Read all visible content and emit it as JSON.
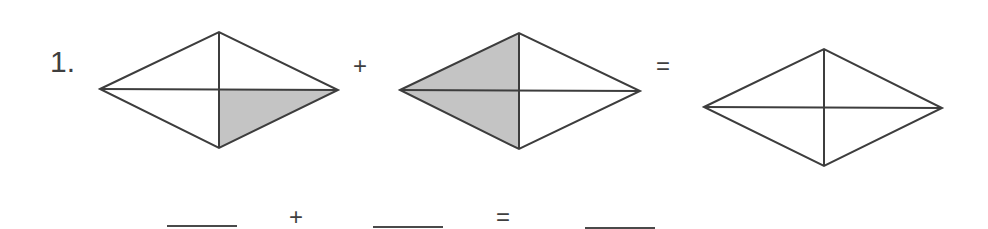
{
  "problem": {
    "number_label": "1.",
    "operators": {
      "plus": "+",
      "equals": "="
    },
    "diamonds": [
      {
        "id": "diamond-1",
        "parts": 4,
        "shaded_parts": 1,
        "shaded_region": "lower-right",
        "points": {
          "left": [
            100,
            89
          ],
          "top": [
            219,
            32
          ],
          "right": [
            338,
            90
          ],
          "bottom": [
            219,
            148
          ]
        }
      },
      {
        "id": "diamond-2",
        "parts": 4,
        "shaded_parts": 2,
        "shaded_region": "left-half",
        "points": {
          "left": [
            400,
            90
          ],
          "top": [
            519,
            33
          ],
          "right": [
            640,
            91
          ],
          "bottom": [
            519,
            149
          ]
        }
      },
      {
        "id": "diamond-3",
        "parts": 4,
        "shaded_parts": 0,
        "shaded_region": "none",
        "points": {
          "left": [
            704,
            107
          ],
          "top": [
            824,
            49
          ],
          "right": [
            942,
            108
          ],
          "bottom": [
            824,
            166
          ]
        }
      }
    ],
    "answer_row": {
      "blanks": [
        "",
        "",
        ""
      ],
      "plus": "+",
      "equals": "="
    },
    "colors": {
      "stroke": "#3d3d3d",
      "shade": "#c4c4c4",
      "background": "#ffffff"
    }
  }
}
